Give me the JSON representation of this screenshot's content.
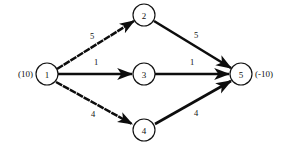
{
  "diagram": {
    "background_color": "#ffffff",
    "stroke_color": "#0d0d0d",
    "node_fill_color": "#ffffff",
    "nodes": [
      {
        "id": "1",
        "label": "1",
        "cx": 47,
        "cy": 74,
        "r": 11
      },
      {
        "id": "2",
        "label": "2",
        "cx": 144,
        "cy": 15,
        "r": 11
      },
      {
        "id": "3",
        "label": "3",
        "cx": 144,
        "cy": 74,
        "r": 11
      },
      {
        "id": "4",
        "label": "4",
        "cx": 144,
        "cy": 130,
        "r": 11
      },
      {
        "id": "5",
        "label": "5",
        "cx": 241,
        "cy": 74,
        "r": 11
      }
    ],
    "supply_labels": [
      {
        "node": "1",
        "text": "(10)",
        "x": 33,
        "y": 74,
        "side": "left"
      },
      {
        "node": "5",
        "text": "(-10)",
        "x": 255,
        "y": 74,
        "side": "right"
      }
    ],
    "edges": [
      {
        "from": "1",
        "to": "2",
        "weight": "5",
        "style": "dashed",
        "x1": 57,
        "y1": 69,
        "x2": 134,
        "y2": 21,
        "label_x": 92,
        "label_y": 36
      },
      {
        "from": "2",
        "to": "5",
        "weight": "5",
        "style": "solid",
        "x1": 154,
        "y1": 21,
        "x2": 231,
        "y2": 68,
        "label_x": 196,
        "label_y": 35
      },
      {
        "from": "1",
        "to": "3",
        "weight": "1",
        "style": "solid",
        "x1": 58,
        "y1": 74,
        "x2": 132,
        "y2": 74,
        "label_x": 96,
        "label_y": 62
      },
      {
        "from": "3",
        "to": "5",
        "weight": "1",
        "style": "solid",
        "x1": 155,
        "y1": 74,
        "x2": 229,
        "y2": 74,
        "label_x": 192,
        "label_y": 62
      },
      {
        "from": "1",
        "to": "4",
        "weight": "4",
        "style": "dashed",
        "x1": 56,
        "y1": 82,
        "x2": 132,
        "y2": 124,
        "label_x": 93,
        "label_y": 114
      },
      {
        "from": "4",
        "to": "5",
        "weight": "4",
        "style": "solid",
        "x1": 155,
        "y1": 124,
        "x2": 231,
        "y2": 81,
        "label_x": 196,
        "label_y": 113
      }
    ]
  }
}
